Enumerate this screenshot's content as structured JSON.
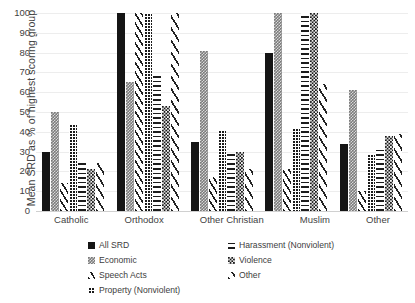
{
  "chart_data": {
    "type": "bar",
    "title": "",
    "xlabel": "",
    "ylabel": "Mean SRD as % of highest scoring group",
    "ylim": [
      0,
      100
    ],
    "yticks": [
      0,
      10,
      20,
      30,
      40,
      50,
      60,
      70,
      80,
      90,
      100
    ],
    "grid": true,
    "legend_position": "bottom",
    "categories": [
      "Catholic",
      "Orthodox",
      "Other Christian",
      "Muslim",
      "Other"
    ],
    "series": [
      {
        "name": "All SRD",
        "pattern": "solid-black",
        "values": [
          30,
          100,
          35,
          80,
          34
        ]
      },
      {
        "name": "Economic",
        "pattern": "checkered-gray",
        "values": [
          50,
          65,
          81,
          100,
          61
        ]
      },
      {
        "name": "Speech Acts",
        "pattern": "diagonal-lines",
        "values": [
          14,
          100,
          17,
          21,
          10
        ]
      },
      {
        "name": "Property (Nonviolent)",
        "pattern": "dense-grid",
        "values": [
          44,
          100,
          41,
          42,
          29
        ]
      },
      {
        "name": "Harassment (Nonviolent)",
        "pattern": "horizontal-lines",
        "values": [
          25,
          69,
          29,
          100,
          31
        ]
      },
      {
        "name": "Violence",
        "pattern": "checkerboard",
        "values": [
          21,
          53,
          30,
          100,
          38
        ]
      },
      {
        "name": "Other",
        "pattern": "diagonal-wide",
        "values": [
          24,
          100,
          21,
          64,
          39
        ]
      }
    ],
    "legend": [
      {
        "label": "All SRD",
        "column": "left",
        "pattern": "solid-black"
      },
      {
        "label": "Harassment (Nonviolent)",
        "column": "right",
        "pattern": "horizontal-lines"
      },
      {
        "label": "Economic",
        "column": "left",
        "pattern": "checkered-gray"
      },
      {
        "label": "Violence",
        "column": "right",
        "pattern": "checkerboard"
      },
      {
        "label": "Speech Acts",
        "column": "left",
        "pattern": "diagonal-lines"
      },
      {
        "label": "Other",
        "column": "right",
        "pattern": "diagonal-wide"
      },
      {
        "label": "Property (Nonviolent)",
        "column": "left",
        "pattern": "dense-grid"
      }
    ],
    "colors": {
      "solid": "#151515",
      "gray": "#7b7b7b",
      "gridline": "#ededed",
      "axis": "#d0d0d0",
      "text": "#3f3f3f",
      "background": "#ffffff"
    }
  }
}
